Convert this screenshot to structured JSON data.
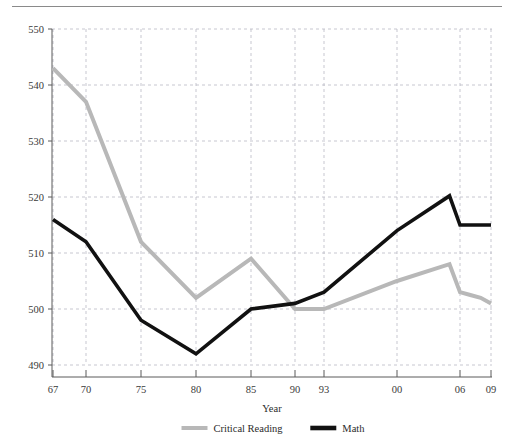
{
  "chart_data": {
    "type": "line",
    "title": "",
    "xlabel": "Year",
    "ylabel": "",
    "xlim": [
      1967,
      2009
    ],
    "ylim": [
      490,
      550
    ],
    "grid": true,
    "legend_position": "bottom",
    "x_tick_labels": [
      "67",
      "70",
      "75",
      "80",
      "85",
      "90",
      "93",
      "00",
      "06",
      "09"
    ],
    "x_tick_values": [
      1967,
      1970,
      1975,
      1980,
      1985,
      1990,
      1993,
      2000,
      2006,
      2009
    ],
    "y_tick_labels": [
      "490",
      "500",
      "510",
      "520",
      "530",
      "540",
      "550"
    ],
    "y_tick_values": [
      490,
      500,
      510,
      520,
      530,
      540,
      550
    ],
    "x": [
      1967,
      1970,
      1975,
      1980,
      1985,
      1990,
      1993,
      2000,
      2005,
      2006,
      2007,
      2008,
      2009
    ],
    "series": [
      {
        "name": "Critical Reading",
        "color": "#b8b8b8",
        "width": 4.0,
        "values": [
          543,
          537,
          512,
          502,
          509,
          500,
          500,
          505,
          508,
          503,
          502.5,
          502,
          501
        ]
      },
      {
        "name": "Math",
        "color": "#111111",
        "width": 3.6,
        "values": [
          516,
          512,
          498,
          492,
          500,
          501,
          503,
          514,
          520.2,
          515,
          515,
          515,
          515
        ]
      }
    ]
  },
  "legend": {
    "items": [
      {
        "label": "Critical Reading",
        "color": "#b8b8b8"
      },
      {
        "label": "Math",
        "color": "#111111"
      }
    ]
  },
  "axis": {
    "x_title": "Year"
  }
}
